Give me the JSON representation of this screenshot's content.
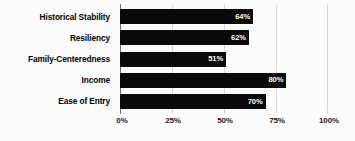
{
  "chart_data": {
    "type": "bar",
    "orientation": "horizontal",
    "title": "",
    "xlabel": "",
    "ylabel": "",
    "categories": [
      "Historical Stability",
      "Resiliency",
      "Family-Centeredness",
      "Income",
      "Ease of Entry"
    ],
    "values": [
      64,
      62,
      51,
      80,
      70
    ],
    "value_labels": [
      "64%",
      "62%",
      "51%",
      "80%",
      "70%"
    ],
    "xlim": [
      0,
      100
    ],
    "xticks": [
      0,
      25,
      50,
      75,
      100
    ],
    "xtick_labels": [
      "0%",
      "25%",
      "50%",
      "75%",
      "100%"
    ],
    "grid": true,
    "legend": false,
    "colors": {
      "bar": "#0a0a0a",
      "value_text": "#ffffff",
      "gridline": "#d8d8d8",
      "axis": "#6d6d6d",
      "background": "#fcfcfc",
      "label_text": "#000000"
    }
  }
}
